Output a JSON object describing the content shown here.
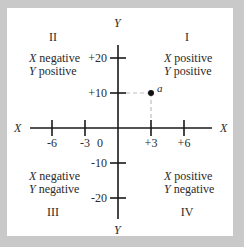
{
  "axes": {
    "x_label": "X",
    "y_label": "Y",
    "origin_label": "0",
    "x_ticks": [
      {
        "value": -6,
        "label": "-6"
      },
      {
        "value": -3,
        "label": "-3"
      },
      {
        "value": 3,
        "label": "+3"
      },
      {
        "value": 6,
        "label": "+6"
      }
    ],
    "y_ticks": [
      {
        "value": 20,
        "label": "+20"
      },
      {
        "value": 10,
        "label": "+10"
      },
      {
        "value": -10,
        "label": "-10"
      },
      {
        "value": -20,
        "label": "-20"
      }
    ]
  },
  "point": {
    "label": "a",
    "x": 3,
    "y": 10
  },
  "quadrants": {
    "q1": {
      "numeral": "I",
      "line1_var": "X",
      "line1": " positive",
      "line2_var": "Y",
      "line2": " positive"
    },
    "q2": {
      "numeral": "II",
      "line1_var": "X",
      "line1": " negative",
      "line2_var": "Y",
      "line2": " positive"
    },
    "q3": {
      "numeral": "III",
      "line1_var": "X",
      "line1": " negative",
      "line2_var": "Y",
      "line2": " negative"
    },
    "q4": {
      "numeral": "IV",
      "line1_var": "X",
      "line1": " positive",
      "line2_var": "Y",
      "line2": " negative"
    }
  },
  "colors": {
    "axis": "#1a1a1a",
    "frame": "#c9c9c9",
    "dash": "#bdbdbd"
  }
}
